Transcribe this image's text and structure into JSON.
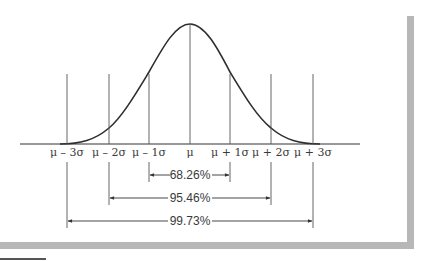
{
  "figure": {
    "type": "normal-distribution-diagram",
    "curve": "bell-curve",
    "colors": {
      "line": "#333333",
      "frame": "#b7b7b7",
      "text": "#3a3a3a"
    }
  },
  "axis": {
    "tick_labels": [
      "μ – 3σ",
      "μ – 2σ",
      "μ – 1σ",
      "μ",
      "μ + 1σ",
      "μ + 2σ",
      "μ + 3σ"
    ]
  },
  "intervals": [
    {
      "label": "68.26%",
      "from": "μ – 1σ",
      "to": "μ + 1σ"
    },
    {
      "label": "95.46%",
      "from": "μ – 2σ",
      "to": "μ + 2σ"
    },
    {
      "label": "99.73%",
      "from": "μ – 3σ",
      "to": "μ + 3σ"
    }
  ]
}
